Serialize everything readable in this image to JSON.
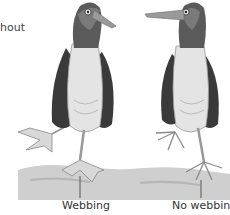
{
  "figure": {
    "cropped_text_fragment": "hout",
    "birds": [
      {
        "id": "left",
        "facing": "right",
        "foot": "webbed"
      },
      {
        "id": "right",
        "facing": "left",
        "foot": "not webbed"
      }
    ],
    "labels": {
      "left": "Webbing",
      "right": "No webbing"
    },
    "colors": {
      "background": "#ffffff",
      "ground": "#c9c9c9",
      "wing": "#3a3a3a",
      "body": "#e2e2e2",
      "beak": "#9a9a9a",
      "feet": "#bdbdbd",
      "leader_line": "#555555"
    }
  }
}
